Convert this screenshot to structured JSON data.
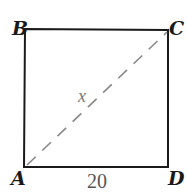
{
  "diagram": {
    "type": "square-with-diagonal",
    "vertices": {
      "A": {
        "label": "A",
        "position": "bottom-left"
      },
      "B": {
        "label": "B",
        "position": "top-left"
      },
      "C": {
        "label": "C",
        "position": "top-right"
      },
      "D": {
        "label": "D",
        "position": "bottom-right"
      }
    },
    "side_label": "20",
    "diagonal_label": "x",
    "diagonal": "A to C (dashed)",
    "colors": {
      "outline": "#1a1a1a",
      "diagonal": "#888888",
      "side_label": "#555555"
    }
  }
}
